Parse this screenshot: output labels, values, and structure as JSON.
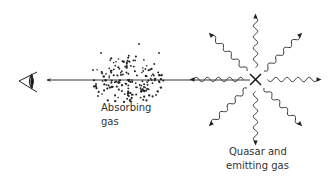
{
  "diagram": {
    "labels": {
      "absorbing_gas_line1": "Absorbing",
      "absorbing_gas_line2": "gas",
      "quasar_line1": "Quasar and",
      "quasar_line2": "emitting gas"
    },
    "elements": {
      "observer": "eye-icon",
      "sightline": "arrow pointing toward observer",
      "absorber": "dotted gas cloud",
      "source": "quasar (X) emitting 8 wavy light rays"
    },
    "colors": {
      "ink": "#222222",
      "text": "#333333",
      "background": "#ffffff"
    },
    "ray_count": 8
  }
}
